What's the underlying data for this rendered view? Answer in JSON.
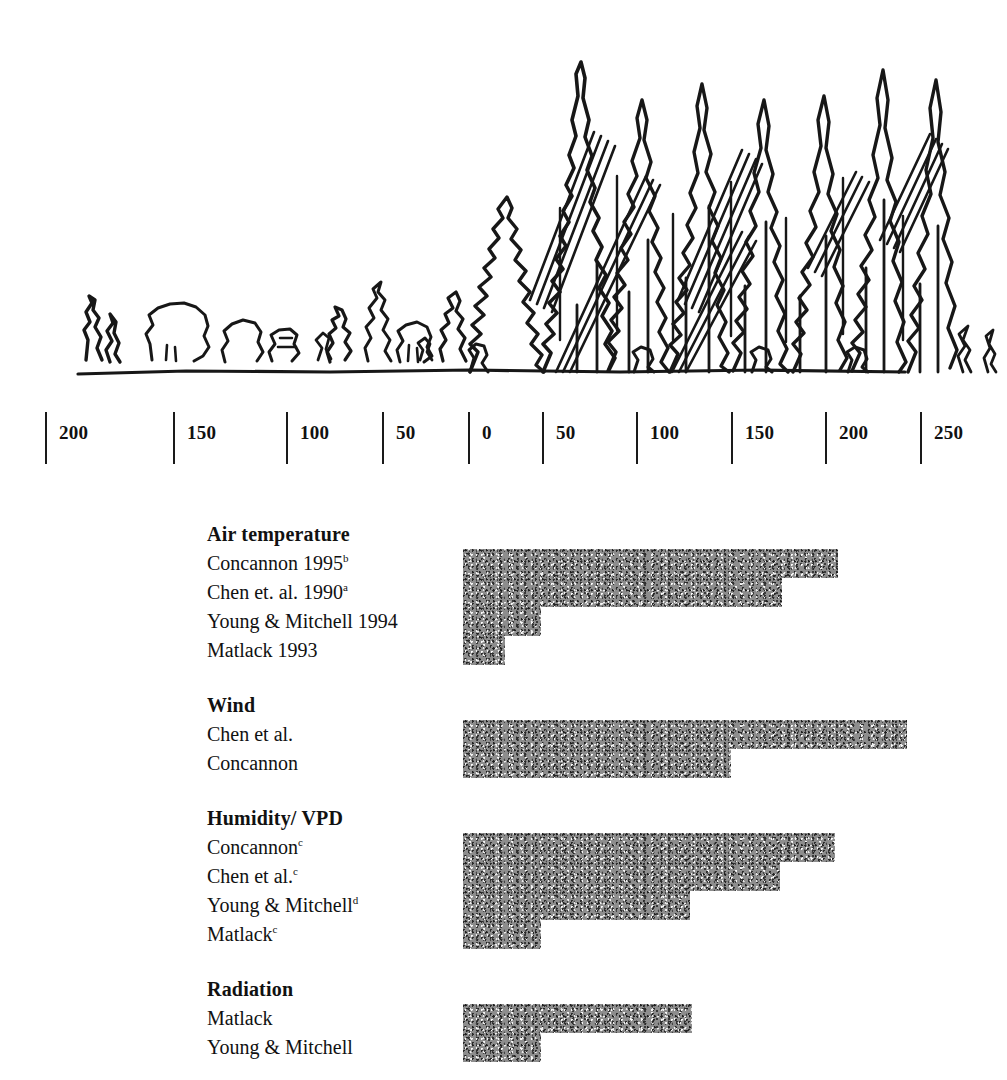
{
  "figure": {
    "profile_caption": "forest-edge profile: clearcut on left, mature conifer forest on right"
  },
  "axis": {
    "unit": "m",
    "zero_value": "0",
    "ticks": [
      {
        "label": "200",
        "value": -200,
        "x": 45
      },
      {
        "label": "150",
        "value": -150,
        "x": 173
      },
      {
        "label": "100",
        "value": -100,
        "x": 286
      },
      {
        "label": "50",
        "value": -50,
        "x": 382
      },
      {
        "label": "0",
        "value": 0,
        "x": 468
      },
      {
        "label": "50",
        "value": 50,
        "x": 542
      },
      {
        "label": "100",
        "value": 100,
        "x": 636
      },
      {
        "label": "150",
        "value": 150,
        "x": 731
      },
      {
        "label": "200",
        "value": 200,
        "x": 825
      },
      {
        "label": "250",
        "value": 250,
        "x": 920
      }
    ]
  },
  "chart_data": {
    "type": "bar",
    "xlabel": "Distance from edge (m)",
    "ylabel": "",
    "orientation": "horizontal",
    "xlim": [
      -225,
      275
    ],
    "grid": false,
    "legend": null,
    "note": "All bars originate at the 0 m forest edge and extend into the forest interior (to the right).",
    "groups": [
      {
        "name": "Air temperature",
        "rows": [
          {
            "label": "Concannon 1995",
            "superscript": "b",
            "value": 195,
            "bar_left": 463,
            "bar_right": 838
          },
          {
            "label": "Chen et. al. 1990",
            "superscript": "a",
            "value": 165,
            "bar_left": 463,
            "bar_right": 782
          },
          {
            "label": "Young & Mitchell 1994",
            "superscript": "",
            "value": 40,
            "bar_left": 463,
            "bar_right": 541
          },
          {
            "label": "Matlack 1993",
            "superscript": "",
            "value": 22,
            "bar_left": 463,
            "bar_right": 505
          }
        ]
      },
      {
        "name": "Wind",
        "rows": [
          {
            "label": "Chen et al.",
            "superscript": "",
            "value": 232,
            "bar_left": 463,
            "bar_right": 907
          },
          {
            "label": "Concannon",
            "superscript": "",
            "value": 140,
            "bar_left": 463,
            "bar_right": 731
          }
        ]
      },
      {
        "name": "Humidity/ VPD",
        "rows": [
          {
            "label": "Concannon",
            "superscript": "c",
            "value": 194,
            "bar_left": 463,
            "bar_right": 835
          },
          {
            "label": "Chen et al.",
            "superscript": "c",
            "value": 165,
            "bar_left": 463,
            "bar_right": 780
          },
          {
            "label": "Young & Mitchell",
            "superscript": "d",
            "value": 118,
            "bar_left": 463,
            "bar_right": 690
          },
          {
            "label": "Matlack",
            "superscript": "c",
            "value": 40,
            "bar_left": 463,
            "bar_right": 541
          }
        ]
      },
      {
        "name": "Radiation",
        "rows": [
          {
            "label": "Matlack",
            "superscript": "",
            "value": 118,
            "bar_left": 463,
            "bar_right": 692
          },
          {
            "label": "Young & Mitchell",
            "superscript": "",
            "value": 40,
            "bar_left": 463,
            "bar_right": 541
          }
        ]
      }
    ]
  },
  "colors": {
    "ink": "#111111",
    "bar_fill": "#8d8d8d",
    "background": "#ffffff"
  }
}
